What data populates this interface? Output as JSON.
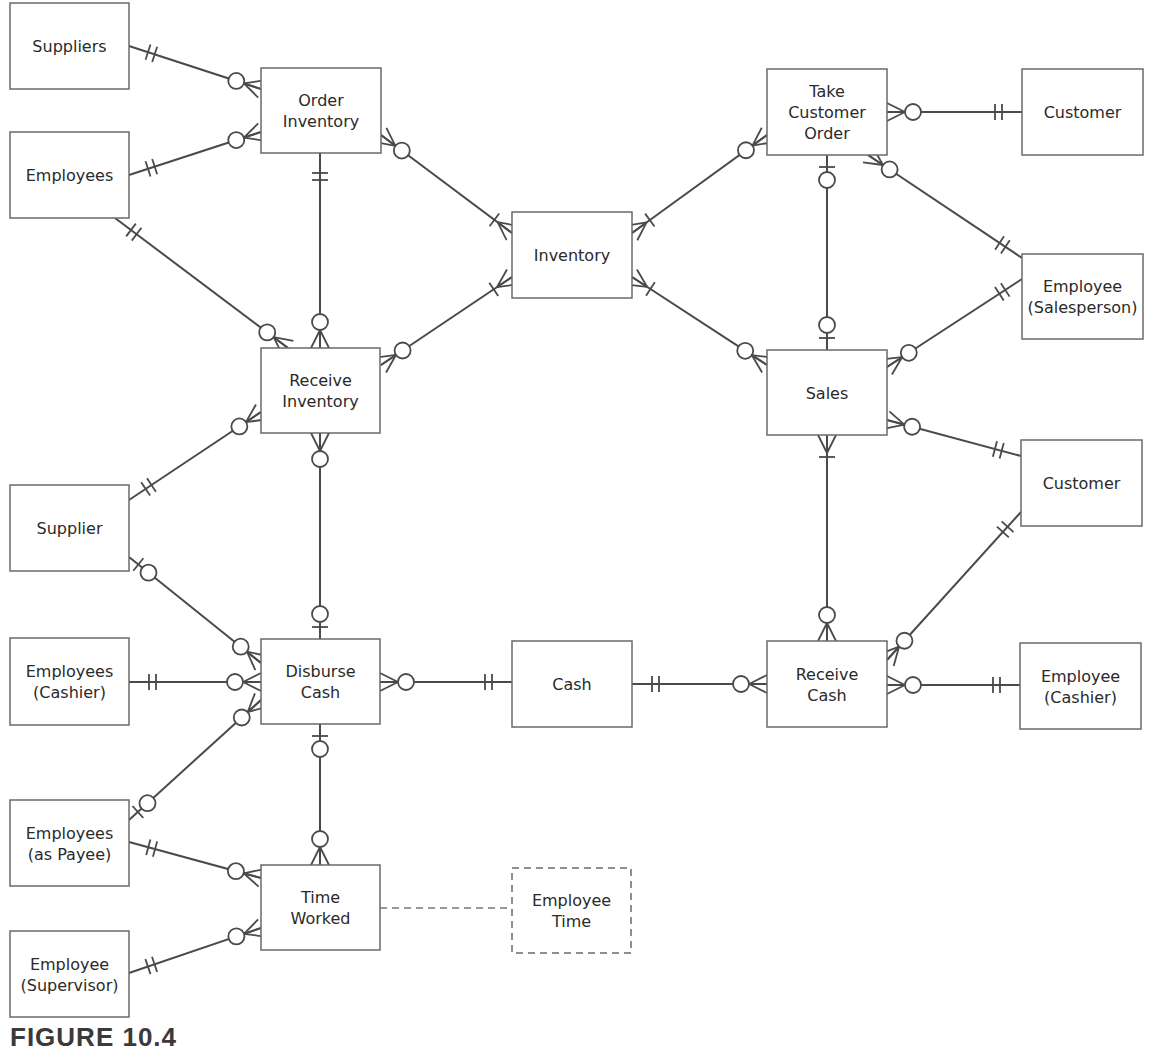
{
  "figure": {
    "caption": "FIGURE 10.4",
    "colors": {
      "stroke": "#4a4a4a",
      "box_border": "#6a6a6a",
      "text": "#2a2a2a",
      "background": "#ffffff"
    }
  },
  "entities": [
    {
      "id": "suppliers",
      "lines": [
        "Suppliers"
      ],
      "x": 10,
      "y": 3,
      "w": 119,
      "h": 86
    },
    {
      "id": "employees",
      "lines": [
        "Employees"
      ],
      "x": 10,
      "y": 132,
      "w": 119,
      "h": 86
    },
    {
      "id": "order_inventory",
      "lines": [
        "Order",
        "Inventory"
      ],
      "x": 261,
      "y": 68,
      "w": 120,
      "h": 85
    },
    {
      "id": "inventory",
      "lines": [
        "Inventory"
      ],
      "x": 512,
      "y": 212,
      "w": 120,
      "h": 86
    },
    {
      "id": "take_customer_order",
      "lines": [
        "Take",
        "Customer",
        "Order"
      ],
      "x": 767,
      "y": 69,
      "w": 120,
      "h": 86
    },
    {
      "id": "customer_top",
      "lines": [
        "Customer"
      ],
      "x": 1022,
      "y": 69,
      "w": 121,
      "h": 86
    },
    {
      "id": "employee_salesperson",
      "lines": [
        "Employee",
        "(Salesperson)"
      ],
      "x": 1022,
      "y": 254,
      "w": 121,
      "h": 85
    },
    {
      "id": "receive_inventory",
      "lines": [
        "Receive",
        "Inventory"
      ],
      "x": 261,
      "y": 348,
      "w": 119,
      "h": 85
    },
    {
      "id": "sales",
      "lines": [
        "Sales"
      ],
      "x": 767,
      "y": 350,
      "w": 120,
      "h": 85
    },
    {
      "id": "customer_mid",
      "lines": [
        "Customer"
      ],
      "x": 1021,
      "y": 440,
      "w": 121,
      "h": 86
    },
    {
      "id": "supplier",
      "lines": [
        "Supplier"
      ],
      "x": 10,
      "y": 485,
      "w": 119,
      "h": 86
    },
    {
      "id": "employees_cashier",
      "lines": [
        "Employees",
        "(Cashier)"
      ],
      "x": 10,
      "y": 638,
      "w": 119,
      "h": 87
    },
    {
      "id": "disburse_cash",
      "lines": [
        "Disburse",
        "Cash"
      ],
      "x": 261,
      "y": 639,
      "w": 119,
      "h": 85
    },
    {
      "id": "cash",
      "lines": [
        "Cash"
      ],
      "x": 512,
      "y": 641,
      "w": 120,
      "h": 86
    },
    {
      "id": "receive_cash",
      "lines": [
        "Receive",
        "Cash"
      ],
      "x": 767,
      "y": 641,
      "w": 120,
      "h": 86
    },
    {
      "id": "employee_cashier",
      "lines": [
        "Employee",
        "(Cashier)"
      ],
      "x": 1020,
      "y": 643,
      "w": 121,
      "h": 86
    },
    {
      "id": "employees_payee",
      "lines": [
        "Employees",
        "(as Payee)"
      ],
      "x": 10,
      "y": 800,
      "w": 119,
      "h": 86
    },
    {
      "id": "time_worked",
      "lines": [
        "Time",
        "Worked"
      ],
      "x": 261,
      "y": 865,
      "w": 119,
      "h": 85
    },
    {
      "id": "employee_time",
      "lines": [
        "Employee",
        "Time"
      ],
      "x": 512,
      "y": 868,
      "w": 119,
      "h": 85,
      "dashed": true
    },
    {
      "id": "employee_supervisor",
      "lines": [
        "Employee",
        "(Supervisor)"
      ],
      "x": 10,
      "y": 931,
      "w": 119,
      "h": 86
    }
  ],
  "relationships": [
    {
      "from": "suppliers",
      "to": "order_inventory",
      "a": [
        129,
        46
      ],
      "b": [
        261,
        89
      ],
      "endA": "one-and-only-one",
      "endB": "zero-or-many"
    },
    {
      "from": "employees",
      "to": "order_inventory",
      "a": [
        129,
        175
      ],
      "b": [
        261,
        132
      ],
      "endA": "one-and-only-one",
      "endB": "zero-or-many"
    },
    {
      "from": "employees",
      "to": "receive_inventory",
      "a": [
        115,
        218
      ],
      "b": [
        288,
        348
      ],
      "endA": "one-and-only-one",
      "endB": "zero-or-many"
    },
    {
      "from": "order_inventory",
      "to": "receive_inventory",
      "a": [
        320,
        153
      ],
      "b": [
        320,
        348
      ],
      "endA": "one-and-only-one",
      "endB": "zero-or-many"
    },
    {
      "from": "order_inventory",
      "to": "inventory",
      "a": [
        381,
        135
      ],
      "b": [
        512,
        233
      ],
      "endA": "zero-or-many",
      "endB": "one-many"
    },
    {
      "from": "receive_inventory",
      "to": "inventory",
      "a": [
        381,
        365
      ],
      "b": [
        512,
        277
      ],
      "endA": "zero-or-many",
      "endB": "one-many"
    },
    {
      "from": "take_customer_order",
      "to": "inventory",
      "a": [
        767,
        135
      ],
      "b": [
        632,
        233
      ],
      "endA": "zero-or-many",
      "endB": "one-many"
    },
    {
      "from": "sales",
      "to": "inventory",
      "a": [
        767,
        365
      ],
      "b": [
        632,
        277
      ],
      "endA": "zero-or-many",
      "endB": "one-many"
    },
    {
      "from": "take_customer_order",
      "to": "customer_top",
      "a": [
        887,
        112
      ],
      "b": [
        1022,
        112
      ],
      "endA": "zero-or-many",
      "endB": "one-and-only-one"
    },
    {
      "from": "take_customer_order",
      "to": "employee_salesperson",
      "a": [
        868,
        155
      ],
      "b": [
        1022,
        258
      ],
      "endA": "zero-or-many",
      "endB": "one-and-only-one"
    },
    {
      "from": "take_customer_order",
      "to": "sales",
      "a": [
        827,
        155
      ],
      "b": [
        827,
        350
      ],
      "endA": "zero-or-one",
      "endB": "zero-or-one"
    },
    {
      "from": "sales",
      "to": "employee_salesperson",
      "a": [
        887,
        367
      ],
      "b": [
        1022,
        279
      ],
      "endA": "zero-or-many",
      "endB": "one-and-only-one"
    },
    {
      "from": "sales",
      "to": "customer_mid",
      "a": [
        887,
        420
      ],
      "b": [
        1021,
        456
      ],
      "endA": "zero-or-many",
      "endB": "one-and-only-one"
    },
    {
      "from": "sales",
      "to": "receive_cash",
      "a": [
        827,
        435
      ],
      "b": [
        827,
        641
      ],
      "endA": "one-many",
      "endB": "zero-or-many"
    },
    {
      "from": "receive_cash",
      "to": "customer_mid",
      "a": [
        887,
        660
      ],
      "b": [
        1021,
        512
      ],
      "endA": "zero-or-many",
      "endB": "one-and-only-one"
    },
    {
      "from": "receive_cash",
      "to": "employee_cashier",
      "a": [
        887,
        685
      ],
      "b": [
        1020,
        685
      ],
      "endA": "zero-or-many",
      "endB": "one-and-only-one"
    },
    {
      "from": "receive_inventory",
      "to": "supplier",
      "a": [
        261,
        412
      ],
      "b": [
        129,
        500
      ],
      "endA": "zero-or-many",
      "endB": "one-and-only-one"
    },
    {
      "from": "receive_inventory",
      "to": "disburse_cash",
      "a": [
        320,
        433
      ],
      "b": [
        320,
        639
      ],
      "endA": "zero-or-many",
      "endB": "zero-or-one"
    },
    {
      "from": "supplier",
      "to": "disburse_cash",
      "a": [
        129,
        557
      ],
      "b": [
        261,
        663
      ],
      "endA": "zero-or-one",
      "endB": "zero-or-many"
    },
    {
      "from": "employees_cashier",
      "to": "disburse_cash",
      "a": [
        129,
        682
      ],
      "b": [
        261,
        682
      ],
      "endA": "one-and-only-one",
      "endB": "zero-or-many"
    },
    {
      "from": "employees_payee",
      "to": "disburse_cash",
      "a": [
        129,
        820
      ],
      "b": [
        261,
        700
      ],
      "endA": "zero-or-one",
      "endB": "zero-or-many"
    },
    {
      "from": "disburse_cash",
      "to": "cash",
      "a": [
        380,
        682
      ],
      "b": [
        512,
        682
      ],
      "endA": "zero-or-many",
      "endB": "one-and-only-one"
    },
    {
      "from": "cash",
      "to": "receive_cash",
      "a": [
        632,
        684
      ],
      "b": [
        767,
        684
      ],
      "endA": "one-and-only-one",
      "endB": "zero-or-many"
    },
    {
      "from": "disburse_cash",
      "to": "time_worked",
      "a": [
        320,
        724
      ],
      "b": [
        320,
        865
      ],
      "endA": "zero-or-one",
      "endB": "zero-or-many"
    },
    {
      "from": "employees_payee",
      "to": "time_worked",
      "a": [
        129,
        842
      ],
      "b": [
        261,
        878
      ],
      "endA": "one-and-only-one",
      "endB": "zero-or-many"
    },
    {
      "from": "employee_supervisor",
      "to": "time_worked",
      "a": [
        129,
        973
      ],
      "b": [
        261,
        928
      ],
      "endA": "one-and-only-one",
      "endB": "zero-or-many"
    },
    {
      "from": "time_worked",
      "to": "employee_time",
      "a": [
        380,
        908
      ],
      "b": [
        512,
        908
      ],
      "dashed": true
    }
  ]
}
